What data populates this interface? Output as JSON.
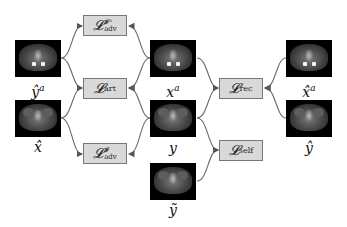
{
  "images": {
    "y_hat_a": {
      "label": "ŷ",
      "sup": "a",
      "has_artifact": true
    },
    "x_hat": {
      "label": "x̂",
      "sup": "",
      "has_artifact": false
    },
    "x_a": {
      "label": "x",
      "sup": "a",
      "has_artifact": true
    },
    "y": {
      "label": "y",
      "sup": "",
      "has_artifact": false
    },
    "y_tilde": {
      "label": "ỹ",
      "sup": "",
      "has_artifact": false
    },
    "x_hat_a": {
      "label": "x̂",
      "sup": "a",
      "has_artifact": true
    },
    "y_hat": {
      "label": "ŷ",
      "sup": "",
      "has_artifact": false
    }
  },
  "losses": {
    "adv_Ia": {
      "symbol": "𝓛",
      "sup": "𝓘ᵃ",
      "sub": "adv"
    },
    "art": {
      "symbol": "𝓛",
      "sup": "",
      "sub": "art"
    },
    "adv_I": {
      "symbol": "𝓛",
      "sup": "𝓘",
      "sub": "adv"
    },
    "rec": {
      "symbol": "𝓛",
      "sup": "",
      "sub": "rec"
    },
    "self": {
      "symbol": "𝓛",
      "sup": "",
      "sub": "self"
    }
  },
  "colors": {
    "loss_box_fill": "#d9d9d9",
    "loss_box_border": "#777777",
    "edge": "#666666"
  }
}
